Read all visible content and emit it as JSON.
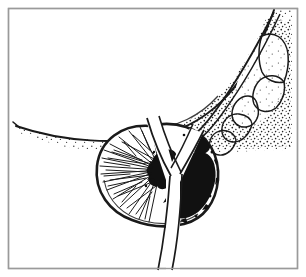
{
  "figure": {
    "medium": "black-and-white line drawing with stipple shading",
    "border_color": "#9a9a9a",
    "ink_color": "#1a1a1a",
    "paper_color": "#ffffff",
    "frame": {
      "x": 8,
      "y": 8,
      "width": 290,
      "height": 261
    }
  },
  "structures": {
    "bladder": {
      "name": "bladder",
      "description": "large curved mass occupying the upper portion, lower margin drawn as a long sweeping contour with dense stipple shading beneath it",
      "shading": "stipple",
      "outline": "M 16,126 C 60,140 120,146 168,133 C 206,122 240,92 262,40 C 268,26 272,16 274,10",
      "stipple_density": "graded, densest near the lower right margin"
    },
    "seminal_vesicle": {
      "name": "seminal-vesicle",
      "description": "lobulated sac-like structure at upper right, drawn as a chain of rounded lobules with light stipple",
      "lobe_count": 5,
      "shading": "light stipple"
    },
    "vas_deferens": {
      "name": "vas-deferens-duct",
      "description": "narrow duct descending from the upper right, passing beside the seminal vesicle and entering the prostate at its upper pole"
    },
    "prostate": {
      "name": "prostate-gland",
      "description": "heart / chestnut shaped gland below the bladder, bisected vertically by the urethra; left lobe shows radiating glandular striations, right lobe largely replaced by tumour",
      "outline": "M 150,126 C 122,124 100,140 97,166 C 94,192 110,212 132,220 C 150,227 168,228 184,224 C 204,219 216,202 218,180 C 220,156 208,134 186,127 C 174,123 162,123 150,126 Z",
      "capsule": "solid dark outline"
    },
    "urethra": {
      "name": "urethra",
      "description": "Y-shaped pale channel running through the centre of the prostate; the fork opens upward toward the bladder neck and the stem exits downward past the apex as two parallel lines",
      "shape": "Y"
    },
    "glandular_striations": {
      "name": "glandular-striations",
      "description": "fine radiating hatch lines fanning outward from the centre of the left lobe toward the capsule",
      "count": 34
    },
    "tumour": {
      "name": "carcinoma-mass",
      "description": "irregular solid black masses: a small focus at the centre of the left lobe and a large confluent mass filling most of the right lobe, with ragged infiltrating margins",
      "fill": "#111111",
      "regions": 3
    }
  },
  "labels": {
    "visible_text": "",
    "note": "no text, captions, axis ticks or legends appear anywhere in the illustration"
  }
}
